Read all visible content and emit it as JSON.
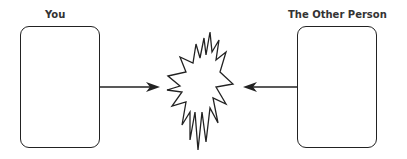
{
  "diagram": {
    "left_party": {
      "label": "You"
    },
    "right_party": {
      "label": "The Other Person"
    },
    "center": {
      "shape": "explosion-burst"
    },
    "arrows": [
      {
        "from": "You",
        "to": "center"
      },
      {
        "from": "The Other Person",
        "to": "center"
      }
    ],
    "colors": {
      "stroke": "#222222",
      "background": "#ffffff"
    }
  }
}
